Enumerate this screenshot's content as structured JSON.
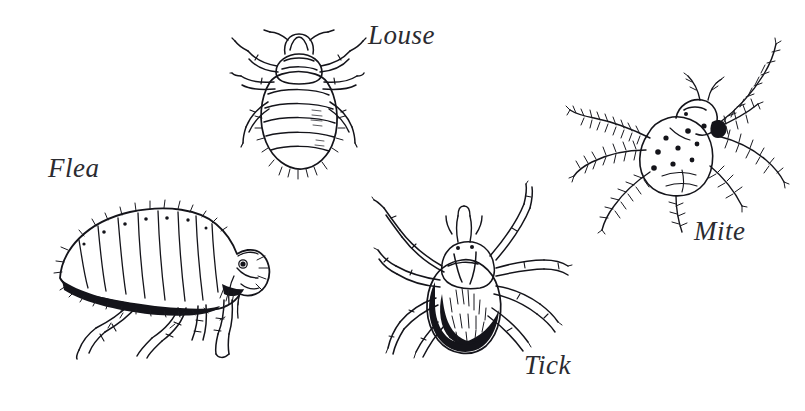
{
  "plate": {
    "title": "Ectoparasites",
    "background_color": "#ffffff",
    "ink_color": "#14141a",
    "label_color": "#2b2b30",
    "width": 805,
    "height": 411,
    "style": "pen-and-ink scientific line drawing"
  },
  "figures": [
    {
      "id": "louse",
      "label": "Louse",
      "view": "dorsal",
      "description": "Wingless insect with broad segmented abdomen and three pairs of clawed legs",
      "legs": 6,
      "position": {
        "x": 232,
        "y": 28,
        "width": 130,
        "height": 145
      },
      "label_position": {
        "x": 368,
        "y": 22
      }
    },
    {
      "id": "flea",
      "label": "Flea",
      "view": "lateral",
      "description": "Laterally flattened insect with segmented bristled abdomen, dark ventral shading and long hind legs",
      "legs": 6,
      "position": {
        "x": 38,
        "y": 188,
        "width": 240,
        "height": 170
      },
      "label_position": {
        "x": 48,
        "y": 155
      }
    },
    {
      "id": "tick",
      "label": "Tick",
      "view": "dorsal",
      "description": "Arachnid with pale scutum, dark stippled abdomen and eight splayed legs",
      "legs": 8,
      "position": {
        "x": 372,
        "y": 182,
        "width": 200,
        "height": 180
      },
      "label_position": {
        "x": 524,
        "y": 352
      }
    },
    {
      "id": "mite",
      "label": "Mite",
      "view": "dorsal",
      "description": "Rounded spotted body with eight feathery bristled legs radiating outward",
      "legs": 8,
      "position": {
        "x": 566,
        "y": 38,
        "width": 230,
        "height": 195
      },
      "label_position": {
        "x": 694,
        "y": 218
      }
    }
  ]
}
